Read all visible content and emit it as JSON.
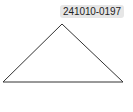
{
  "label": {
    "text": "241010-0197",
    "background": "#e6e6e6"
  },
  "shape": {
    "type": "triangle",
    "points": "62,24 3,82 123,82",
    "stroke": "#333333",
    "fill": "#ffffff"
  }
}
